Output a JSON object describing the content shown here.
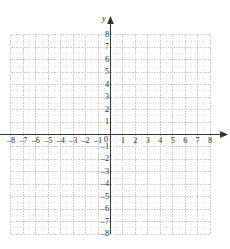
{
  "figure": {
    "axis_label_x": "x",
    "axis_label_y": "y",
    "origin_label": "0",
    "bleed_through_text": "",
    "colors": {
      "background": "#ffffff",
      "axis": "#333333",
      "major_grid": "#b9b9b9",
      "minor_grid": "#dcdcdc",
      "label": "#2c2c2c"
    }
  },
  "chart_data": {
    "type": "scatter",
    "title": "",
    "xlabel": "x",
    "ylabel": "y",
    "xlim": [
      -8,
      8
    ],
    "ylim": [
      -8,
      8
    ],
    "xticks": [
      -8,
      -7,
      -6,
      -5,
      -4,
      -3,
      -2,
      -1,
      0,
      1,
      2,
      3,
      4,
      5,
      6,
      7,
      8
    ],
    "yticks": [
      -8,
      -7,
      -6,
      -5,
      -4,
      -3,
      -2,
      -1,
      0,
      1,
      2,
      3,
      4,
      5,
      6,
      7,
      8
    ],
    "xticklabels": [
      "–8",
      "–7",
      "–6",
      "–5",
      "–4",
      "–3",
      "–2",
      "–1",
      "0",
      "1",
      "2",
      "3",
      "4",
      "5",
      "6",
      "7",
      "8"
    ],
    "yticklabels": [
      "–8",
      "–7",
      "–6",
      "–5",
      "–4",
      "–3",
      "–2",
      "–1",
      "0",
      "1",
      "2",
      "3",
      "4",
      "5",
      "6",
      "7",
      "8"
    ],
    "grid": true,
    "minor_grid": true,
    "minor_subdivisions": 2,
    "legend": null,
    "series": [],
    "x": [],
    "y": [],
    "annotations": [],
    "axis_arrows": {
      "x_right": true,
      "x_left": false,
      "y_top": true,
      "y_bottom": false
    }
  }
}
